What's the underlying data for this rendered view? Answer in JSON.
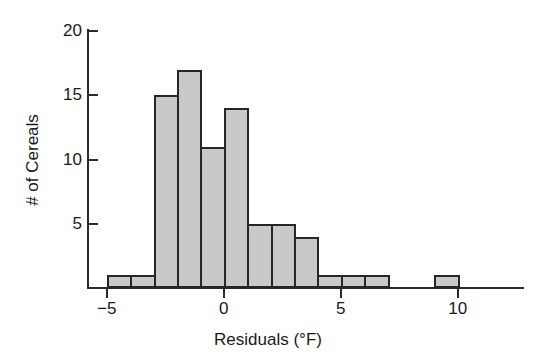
{
  "chart_data": {
    "type": "bar",
    "title": "",
    "subtitle": "",
    "xlabel": "Residuals (°F)",
    "ylabel": "# of Cereals",
    "grid": false,
    "legend": "none",
    "xlim": [
      -5.8,
      11.2
    ],
    "ylim": [
      0,
      21
    ],
    "bin_width": 1,
    "xticks": [
      -5,
      0,
      5,
      10
    ],
    "xtick_labels": [
      "−5",
      "0",
      "5",
      "10"
    ],
    "yticks": [
      5,
      10,
      15,
      20
    ],
    "ytick_labels": [
      "5",
      "10",
      "15",
      "20"
    ],
    "bin_starts": [
      -5,
      -4,
      -3,
      -2,
      -1,
      0,
      1,
      2,
      3,
      4,
      5,
      6,
      9
    ],
    "categories": [
      "-5 to -4",
      "-4 to -3",
      "-3 to -2",
      "-2 to -1",
      "-1 to 0",
      "0 to 1",
      "1 to 2",
      "2 to 3",
      "3 to 4",
      "4 to 5",
      "5 to 6",
      "6 to 7",
      "9 to 10"
    ],
    "values": [
      1,
      1,
      15,
      17,
      11,
      14,
      5,
      5,
      4,
      1,
      1,
      1,
      1
    ],
    "bar_fill": "#c9c9c9",
    "bar_edge": "#262626",
    "axis_color": "#2b2b2b"
  }
}
